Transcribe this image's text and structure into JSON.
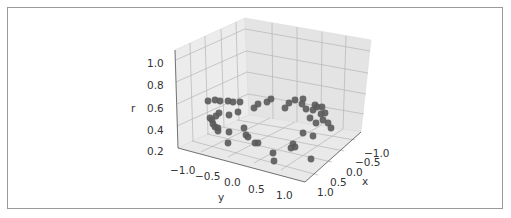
{
  "chart_data": {
    "type": "scatter3d",
    "title": "",
    "xlabel": "x",
    "ylabel": "y",
    "zlabel": "r",
    "x_ticks": [
      "−1.0",
      "−0.5",
      "0.0",
      "0.5",
      "1.0"
    ],
    "y_ticks": [
      "−1.0",
      "−0.5",
      "0.0",
      "0.5",
      "1.0"
    ],
    "z_ticks": [
      "0.2",
      "0.4",
      "0.6",
      "0.8",
      "1.0"
    ],
    "xlim": [
      -1.2,
      1.2
    ],
    "ylim": [
      -1.2,
      1.2
    ],
    "zlim": [
      0.2,
      1.05
    ],
    "grid": true,
    "marker_color": "#5a5a5a",
    "pane_color": "#ebebeb",
    "points_screen": [
      [
        208,
        101
      ],
      [
        215,
        100
      ],
      [
        220,
        101
      ],
      [
        228,
        101
      ],
      [
        233,
        102
      ],
      [
        238,
        112
      ],
      [
        240,
        102
      ],
      [
        254,
        108
      ],
      [
        258,
        104
      ],
      [
        267,
        102
      ],
      [
        271,
        99
      ],
      [
        285,
        108
      ],
      [
        289,
        103
      ],
      [
        295,
        100
      ],
      [
        303,
        99
      ],
      [
        302,
        104
      ],
      [
        306,
        109
      ],
      [
        313,
        110
      ],
      [
        317,
        107
      ],
      [
        322,
        107
      ],
      [
        321,
        114
      ],
      [
        325,
        113
      ],
      [
        328,
        123
      ],
      [
        315,
        105
      ],
      [
        310,
        118
      ],
      [
        323,
        120
      ],
      [
        331,
        128
      ],
      [
        316,
        123
      ],
      [
        219,
        113
      ],
      [
        216,
        116
      ],
      [
        212,
        120
      ],
      [
        213,
        124
      ],
      [
        218,
        128
      ],
      [
        210,
        118
      ],
      [
        229,
        115
      ],
      [
        215,
        127
      ],
      [
        218,
        131
      ],
      [
        229,
        132
      ],
      [
        244,
        128
      ],
      [
        246,
        135
      ],
      [
        248,
        137
      ],
      [
        255,
        143
      ],
      [
        258,
        143
      ],
      [
        228,
        143
      ],
      [
        273,
        153
      ],
      [
        274,
        161
      ],
      [
        293,
        144
      ],
      [
        295,
        147
      ],
      [
        291,
        148
      ],
      [
        303,
        133
      ],
      [
        313,
        136
      ],
      [
        311,
        159
      ]
    ]
  }
}
